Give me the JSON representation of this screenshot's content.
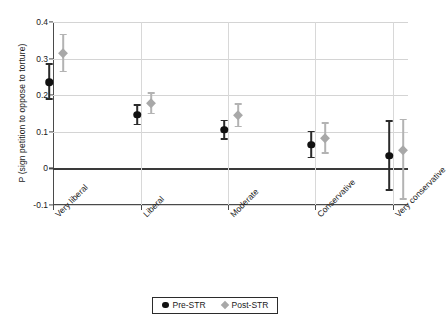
{
  "chart_data": {
    "type": "scatter",
    "title": "",
    "xlabel": "",
    "ylabel": "P (sign petition to oppose to torture)",
    "categories": [
      "Very liberal",
      "Liberal",
      "Moderate",
      "Conservative",
      "Very conservative"
    ],
    "ylim": [
      -0.1,
      0.4
    ],
    "yticks": [
      "0.4",
      "0.3",
      "0.2",
      "0.1",
      "0",
      "-0.1"
    ],
    "ytick_values": [
      0.4,
      0.3,
      0.2,
      0.1,
      0,
      -0.1
    ],
    "grid": true,
    "legend_position": "bottom-center",
    "zero_reference_line": 0,
    "series": [
      {
        "name": "Pre-STR",
        "marker": "circle",
        "color": "#111111",
        "values": [
          0.235,
          0.146,
          0.105,
          0.065,
          0.035
        ],
        "ci_low": [
          0.188,
          0.118,
          0.078,
          0.028,
          -0.062
        ],
        "ci_high": [
          0.287,
          0.175,
          0.133,
          0.103,
          0.131
        ]
      },
      {
        "name": "Post-STR",
        "marker": "diamond",
        "color": "#a8a8a8",
        "values": [
          0.315,
          0.178,
          0.145,
          0.082,
          0.05
        ],
        "ci_low": [
          0.262,
          0.148,
          0.112,
          0.04,
          -0.086
        ],
        "ci_high": [
          0.368,
          0.208,
          0.178,
          0.126,
          0.136
        ]
      }
    ]
  },
  "legend": {
    "entries": [
      {
        "label": "Pre-STR",
        "marker": "circle",
        "color": "#111111"
      },
      {
        "label": "Post-STR",
        "marker": "diamond",
        "color": "#a8a8a8"
      }
    ]
  }
}
